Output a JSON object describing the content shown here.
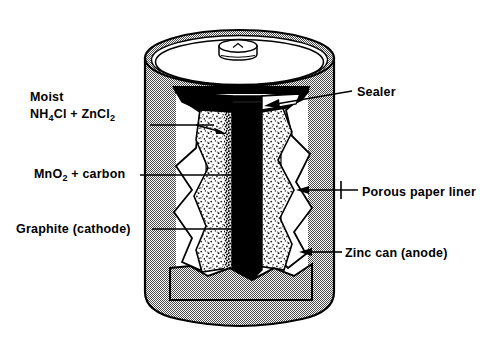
{
  "figure": {
    "background_color": "#ffffff",
    "width": 482,
    "height": 346
  },
  "labels": {
    "moist_line1": "Moist",
    "moist_formula_a": "NH",
    "moist_sub_a": "4",
    "moist_mid_a": "Cl  +  ZnCl",
    "moist_sub_b": "2",
    "mno2_a": "MnO",
    "mno2_sub": "2",
    "mno2_b": "  +  carbon",
    "graphite": "Graphite  (cathode)",
    "sealer": "Sealer",
    "porous": "Porous  paper  liner",
    "zinc": "Zinc can (anode)"
  },
  "colors": {
    "outline": "#000000",
    "zinc_can_fill": "#c9c9c9",
    "graphite_rod": "#000000",
    "paste_fill": "#ffffff",
    "paper_liner": "#ffffff",
    "top_face": "#ffffff",
    "rim_band": "#c9c9c9",
    "leader_line": "#000000"
  },
  "parts": [
    {
      "name": "zinc-can",
      "label": "Zinc can (anode)"
    },
    {
      "name": "porous-paper-liner",
      "label": "Porous  paper  liner"
    },
    {
      "name": "manganese-dioxide-carbon-paste",
      "label": "MnO2 + carbon"
    },
    {
      "name": "graphite-rod",
      "label": "Graphite  (cathode)"
    },
    {
      "name": "electrolyte-paste",
      "label": "Moist NH4Cl + ZnCl2"
    },
    {
      "name": "sealer",
      "label": "Sealer"
    },
    {
      "name": "terminal-cap",
      "label": "terminal cap"
    }
  ]
}
